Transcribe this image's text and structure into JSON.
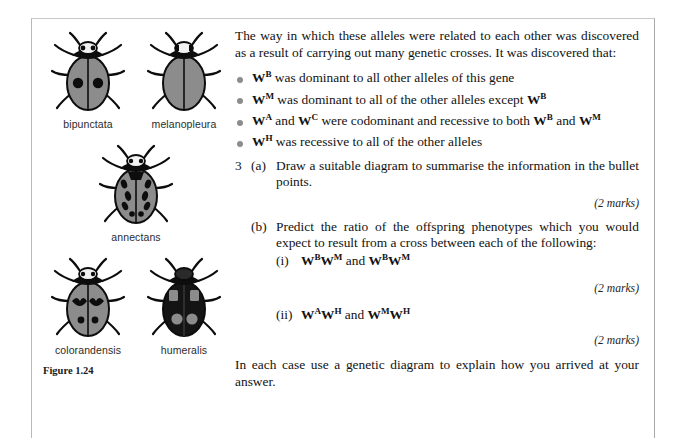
{
  "figure": {
    "caption": "Figure 1.24",
    "specimens": [
      {
        "name": "bipunctata",
        "pattern": "grey-with-two-black-spots"
      },
      {
        "name": "melanopleura",
        "pattern": "plain-grey"
      },
      {
        "name": "annectans",
        "pattern": "grey-with-many-black-dashes"
      },
      {
        "name": "colorandensis",
        "pattern": "grey-with-heart-spots-and-dots"
      },
      {
        "name": "humeralis",
        "pattern": "black-with-grey-patches"
      }
    ],
    "body_grey": "#8c8c8c",
    "marking_black": "#0d0d0d"
  },
  "text": {
    "intro": "The way in which these alleles were related to each other was discovered as a result of carrying out many genetic crosses. It was discovered that:",
    "bullets": [
      "was dominant to all other alleles of this gene",
      "was dominant to all of the other alleles except",
      "and",
      "was recessive to all of the other alleles"
    ],
    "bullet1_allele": "W",
    "bullet1_sup": "B",
    "bullet2_allele": "W",
    "bullet2_sup": "M",
    "bullet2_tail_allele": "W",
    "bullet2_tail_sup": "B",
    "bullet3_a1": "W",
    "bullet3_s1": "A",
    "bullet3_a2": "W",
    "bullet3_s2": "C",
    "bullet3_mid": "were codominant and recessive to both",
    "bullet3_a3": "W",
    "bullet3_s3": "B",
    "bullet3_and": "and",
    "bullet3_a4": "W",
    "bullet3_s4": "M",
    "bullet4_allele": "W",
    "bullet4_sup": "H",
    "question_number": "3",
    "part_a_label": "(a)",
    "part_a_text": "Draw a suitable diagram to summarise the information in the bullet points.",
    "marks_a": "(2 marks)",
    "part_b_label": "(b)",
    "part_b_text": "Predict the ratio of the offspring phenotypes which you would expect to result from a cross between each of the following:",
    "sub_i_label": "(i)",
    "sub_i_cross": {
      "a1": "W",
      "s1": "B",
      "a2": "W",
      "s2": "M",
      "joiner": "and",
      "a3": "W",
      "s3": "B",
      "a4": "W",
      "s4": "M"
    },
    "marks_i": "(2 marks)",
    "sub_ii_label": "(ii)",
    "sub_ii_cross": {
      "a1": "W",
      "s1": "A",
      "a2": "W",
      "s2": "H",
      "joiner": "and",
      "a3": "W",
      "s3": "M",
      "a4": "W",
      "s4": "H"
    },
    "marks_ii": "(2 marks)",
    "closing": "In each case use a genetic diagram to explain how you arrived at your answer."
  }
}
